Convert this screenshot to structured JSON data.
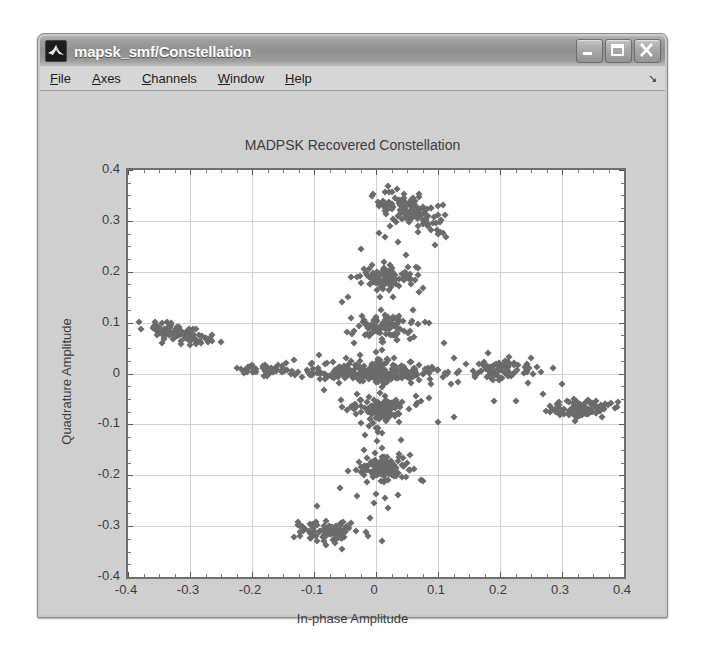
{
  "window": {
    "title": "mapsk_smf/Constellation",
    "app_icon": "matlab-membrane-icon",
    "controls": {
      "minimize": "minimize-button",
      "maximize": "maximize-button",
      "close": "close-button"
    }
  },
  "menu": {
    "items": [
      {
        "label": "File",
        "accel": "F"
      },
      {
        "label": "Axes",
        "accel": "A"
      },
      {
        "label": "Channels",
        "accel": "C"
      },
      {
        "label": "Window",
        "accel": "W"
      },
      {
        "label": "Help",
        "accel": "H"
      }
    ],
    "overflow_glyph": "↘"
  },
  "colors": {
    "axes_background": "#ffffff",
    "figure_background": "#cfcfcf",
    "marker": "#6b6b6b",
    "grid": "#d2d2d2",
    "axis_line": "#6e6e6e",
    "title_bar_text": "#ffffff"
  },
  "chart_data": {
    "type": "scatter",
    "title": "MADPSK Recovered Constellation",
    "xlabel": "In-phase Amplitude",
    "ylabel": "Quadrature Amplitude",
    "xlim": [
      -0.4,
      0.4
    ],
    "ylim": [
      -0.4,
      0.4
    ],
    "xticks": [
      -0.4,
      -0.3,
      -0.2,
      -0.1,
      0,
      0.1,
      0.2,
      0.3,
      0.4
    ],
    "yticks": [
      -0.4,
      -0.3,
      -0.2,
      -0.1,
      0,
      0.1,
      0.2,
      0.3,
      0.4
    ],
    "xtick_labels": [
      "-0.4",
      "-0.3",
      "-0.2",
      "-0.1",
      "0",
      "0.1",
      "0.2",
      "0.3",
      "0.4"
    ],
    "ytick_labels": [
      "-0.4",
      "-0.3",
      "-0.2",
      "-0.1",
      "0",
      "0.1",
      "0.2",
      "0.3",
      "0.4"
    ],
    "grid": true,
    "legend": null,
    "marker": "diamond",
    "marker_size": 5,
    "series": [
      {
        "name": "Recovered symbols",
        "color": "#6b6b6b",
        "clusters": [
          {
            "name": "upper-right-high",
            "cx": 0.055,
            "cy": 0.318,
            "sx": 0.028,
            "sy": 0.016,
            "n": 120,
            "tilt": -0.45
          },
          {
            "name": "upper-mid",
            "cx": 0.022,
            "cy": 0.188,
            "sx": 0.02,
            "sy": 0.01,
            "n": 95,
            "tilt": 0.0
          },
          {
            "name": "upper-low",
            "cx": 0.012,
            "cy": 0.092,
            "sx": 0.022,
            "sy": 0.012,
            "n": 85,
            "tilt": 0.0
          },
          {
            "name": "origin-band",
            "cx": 0.008,
            "cy": 0.002,
            "sx": 0.048,
            "sy": 0.012,
            "n": 160,
            "tilt": 0.0
          },
          {
            "name": "lower-high",
            "cx": 0.005,
            "cy": -0.07,
            "sx": 0.024,
            "sy": 0.012,
            "n": 90,
            "tilt": 0.0
          },
          {
            "name": "lower-mid",
            "cx": 0.012,
            "cy": -0.188,
            "sx": 0.022,
            "sy": 0.012,
            "n": 100,
            "tilt": 0.0
          },
          {
            "name": "lower-left-deep",
            "cx": -0.072,
            "cy": -0.312,
            "sx": 0.024,
            "sy": 0.01,
            "n": 95,
            "tilt": 0.0
          },
          {
            "name": "left-arm",
            "cx": -0.315,
            "cy": 0.078,
            "sx": 0.026,
            "sy": 0.008,
            "n": 95,
            "tilt": -0.25
          },
          {
            "name": "right-inner",
            "cx": 0.205,
            "cy": 0.008,
            "sx": 0.022,
            "sy": 0.009,
            "n": 85,
            "tilt": 0.0
          },
          {
            "name": "right-outer",
            "cx": 0.33,
            "cy": -0.07,
            "sx": 0.026,
            "sy": 0.009,
            "n": 90,
            "tilt": 0.1
          },
          {
            "name": "left-inner",
            "cx": -0.175,
            "cy": 0.008,
            "sx": 0.02,
            "sy": 0.007,
            "n": 45,
            "tilt": 0.0
          },
          {
            "name": "axis-scatter-h",
            "cx": -0.04,
            "cy": 0.0,
            "sx": 0.065,
            "sy": 0.006,
            "n": 70,
            "tilt": 0.0
          },
          {
            "name": "axis-scatter-v",
            "cx": 0.01,
            "cy": -0.01,
            "sx": 0.007,
            "sy": 0.12,
            "n": 60,
            "tilt": 0.0
          }
        ],
        "outliers": [
          [
            -0.33,
            0.1
          ],
          [
            -0.345,
            0.06
          ],
          [
            -0.275,
            0.07
          ],
          [
            -0.265,
            0.075
          ],
          [
            -0.225,
            0.01
          ],
          [
            -0.205,
            0.012
          ],
          [
            -0.15,
            0.005
          ],
          [
            -0.13,
            -0.002
          ],
          [
            -0.105,
            0.018
          ],
          [
            -0.09,
            -0.01
          ],
          [
            -0.07,
            0.022
          ],
          [
            -0.06,
            -0.018
          ],
          [
            -0.045,
            0.15
          ],
          [
            -0.04,
            0.11
          ],
          [
            -0.035,
            0.06
          ],
          [
            -0.03,
            -0.04
          ],
          [
            -0.025,
            0.245
          ],
          [
            -0.02,
            0.205
          ],
          [
            -0.055,
            0.14
          ],
          [
            -0.018,
            -0.12
          ],
          [
            -0.02,
            -0.15
          ],
          [
            -0.058,
            -0.225
          ],
          [
            -0.03,
            -0.24
          ],
          [
            -0.095,
            -0.26
          ],
          [
            -0.12,
            -0.3
          ],
          [
            -0.055,
            -0.345
          ],
          [
            -0.08,
            -0.338
          ],
          [
            0.015,
            0.268
          ],
          [
            0.035,
            0.258
          ],
          [
            0.1,
            0.33
          ],
          [
            0.108,
            0.332
          ],
          [
            0.07,
            0.352
          ],
          [
            0.045,
            0.352
          ],
          [
            0.03,
            0.345
          ],
          [
            0.048,
            0.232
          ],
          [
            0.065,
            0.21
          ],
          [
            0.07,
            0.16
          ],
          [
            0.06,
            0.125
          ],
          [
            0.085,
            0.1
          ],
          [
            0.11,
            0.06
          ],
          [
            0.125,
            0.03
          ],
          [
            0.145,
            0.018
          ],
          [
            0.16,
            -0.002
          ],
          [
            0.25,
            0.03
          ],
          [
            0.245,
            -0.018
          ],
          [
            0.27,
            -0.04
          ],
          [
            0.285,
            0.01
          ],
          [
            0.3,
            -0.02
          ],
          [
            0.37,
            -0.06
          ],
          [
            0.365,
            -0.085
          ],
          [
            0.225,
            -0.055
          ],
          [
            0.19,
            -0.055
          ],
          [
            0.18,
            0.04
          ],
          [
            0.04,
            -0.13
          ],
          [
            0.055,
            -0.16
          ],
          [
            0.035,
            -0.238
          ],
          [
            0.075,
            -0.212
          ],
          [
            0.02,
            -0.265
          ],
          [
            -0.01,
            -0.285
          ],
          [
            0.01,
            -0.33
          ],
          [
            0.1,
            -0.095
          ],
          [
            0.085,
            -0.048
          ],
          [
            0.125,
            -0.085
          ]
        ]
      }
    ]
  }
}
